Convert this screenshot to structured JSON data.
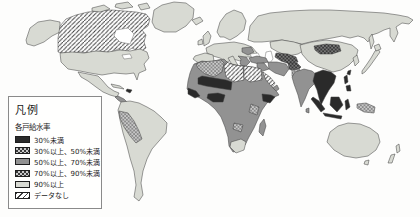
{
  "figure": {
    "type": "choropleth-world-map",
    "background_color": "#ffffff",
    "outline_color": "#3c3c3c"
  },
  "legend": {
    "title": "凡例",
    "subtitle": "各戸給水率",
    "items": [
      {
        "label": "30%未満",
        "pattern": "solid",
        "color": "#2a2a2a"
      },
      {
        "label": "30%以上、50%未満",
        "pattern": "light-dots-on-dark",
        "color": "#3a3a3a",
        "dot_color": "#c9c9c9"
      },
      {
        "label": "50%以上、70%未満",
        "pattern": "solid",
        "color": "#929292"
      },
      {
        "label": "70%以上、90%未満",
        "pattern": "dark-dots-on-light",
        "color": "#c8c8c8",
        "dot_color": "#383838"
      },
      {
        "label": "90%以上",
        "pattern": "solid",
        "color": "#d8dad3"
      },
      {
        "label": "データなし",
        "pattern": "diagonal-hatch",
        "color": "#ffffff",
        "line_color": "#3f3f3f"
      }
    ]
  },
  "map": {
    "observed_shading": [
      {
        "area": "Canada",
        "category": "データなし"
      },
      {
        "area": "Alaska / United States / Mexico / Greenland",
        "category": "90%以上"
      },
      {
        "area": "Central America",
        "category": "50%以上、70%未満"
      },
      {
        "area": "Cuba",
        "category": "90%以上"
      },
      {
        "area": "Hispaniola",
        "category": "30%未満"
      },
      {
        "area": "Brazil / Argentina / Chile / Colombia / Venezuela",
        "category": "90%以上"
      },
      {
        "area": "Ecuador / Peru / Bolivia",
        "category": "70%以上、90%未満"
      },
      {
        "area": "Europe / Russia / Scandinavia / UK / Iberia",
        "category": "90%以上"
      },
      {
        "area": "Balkans / Eastern Europe patches",
        "category": "50%以上、70%未満"
      },
      {
        "area": "Turkey / Iran / Iraq",
        "category": "50%以上、70%未満"
      },
      {
        "area": "Saudi Arabia",
        "category": "データなし"
      },
      {
        "area": "Libya / Egypt",
        "category": "データなし"
      },
      {
        "area": "Algeria",
        "category": "70%以上、90%未満"
      },
      {
        "area": "Morocco / Mauritania / Chad / Sudan / Central Africa / Madagascar",
        "category": "50%以上、70%未満"
      },
      {
        "area": "Mali / Niger / Nigeria / Guinea coast / Ethiopia",
        "category": "30%未満"
      },
      {
        "area": "East Africa / Zambia patches",
        "category": "70%以上、90%未満"
      },
      {
        "area": "South Africa",
        "category": "90%以上"
      },
      {
        "area": "Central Asia / Afghanistan / Mongolia",
        "category": "30%以上、50%未満"
      },
      {
        "area": "Pakistan",
        "category": "70%以上、90%未満"
      },
      {
        "area": "India / Sri Lanka",
        "category": "50%以上、70%未満"
      },
      {
        "area": "Kazakhstan / China / Korea / Japan",
        "category": "90%以上"
      },
      {
        "area": "Indochina / Indonesia / Philippines / Taiwan",
        "category": "30%未満"
      },
      {
        "area": "New Guinea",
        "category": "70%以上、90%未満"
      },
      {
        "area": "Australia / New Zealand",
        "category": "90%以上"
      }
    ]
  }
}
